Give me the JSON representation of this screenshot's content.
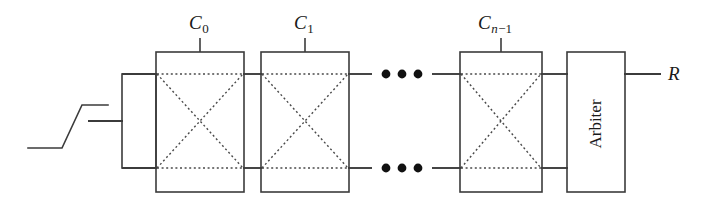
{
  "figure": {
    "type": "circuit-diagram",
    "background_color": "#ffffff",
    "line_color": "#3b3b3b",
    "text_color": "#1a1a1a"
  },
  "labels": {
    "c0": {
      "base": "C",
      "sub": "0"
    },
    "c1": {
      "base": "C",
      "sub": "1"
    },
    "cn1": {
      "base": "C",
      "sub_italic": "n",
      "sub_rest": "−1"
    },
    "output": "R",
    "arbiter": "Arbiter"
  },
  "blocks": [
    {
      "name": "input-buffer",
      "label": "",
      "x": 122,
      "y": 74,
      "w": 34,
      "h": 94
    },
    {
      "name": "c-element-0",
      "label": "C0",
      "x": 156,
      "y": 52,
      "w": 88,
      "h": 140
    },
    {
      "name": "c-element-1",
      "label": "C1",
      "x": 261,
      "y": 52,
      "w": 88,
      "h": 140
    },
    {
      "name": "c-element-n-1",
      "label": "Cn-1",
      "x": 460,
      "y": 52,
      "w": 82,
      "h": 140
    },
    {
      "name": "arbiter",
      "label": "Arbiter",
      "x": 567,
      "y": 52,
      "w": 58,
      "h": 140
    }
  ],
  "rails": {
    "top_y": 74,
    "bottom_y": 168,
    "input_y": 121
  },
  "ellipsis": {
    "glyph": "•",
    "count": 3,
    "positions": [
      {
        "rail": "top",
        "y": 74
      },
      {
        "rail": "bottom",
        "y": 168
      }
    ]
  },
  "waveform": {
    "name": "rising-edge-step",
    "description": "low level, rising ramp, high level"
  }
}
